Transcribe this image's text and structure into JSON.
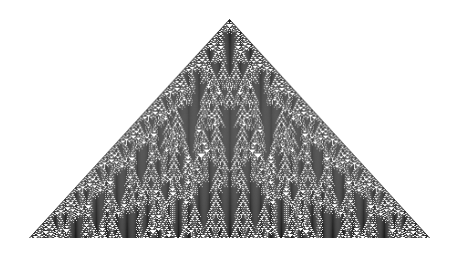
{
  "figure": {
    "type": "cellular-automaton",
    "background": "#ffffff",
    "cell_color": "#1a1a1a",
    "apex": {
      "x": 229.5,
      "y": 19
    },
    "bottom_y": 238,
    "left_x": 29,
    "right_x": 430,
    "generations": 220,
    "rule": {
      "kind": "totalistic-3color",
      "code": 1635
    }
  }
}
